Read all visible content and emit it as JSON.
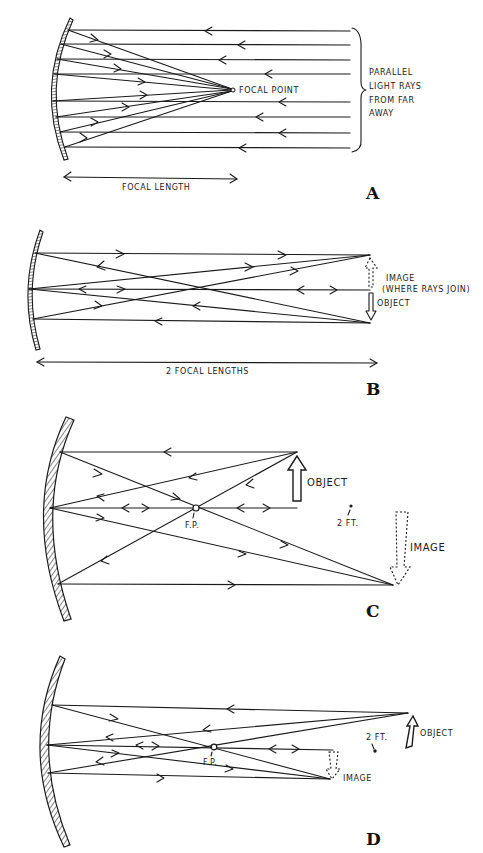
{
  "figure": {
    "ink_color": "#1a1a1a",
    "background": "#ffffff"
  },
  "panels": {
    "A": {
      "letter": "A",
      "labels": {
        "focal_point": "FOCAL POINT",
        "parallel_1": "PARALLEL",
        "parallel_2": "LIGHT RAYS",
        "parallel_3": "FROM FAR",
        "parallel_4": "AWAY",
        "focal_length": "FOCAL LENGTH"
      }
    },
    "B": {
      "letter": "B",
      "labels": {
        "image_1": "IMAGE",
        "image_2": "(WHERE RAYS JOIN)",
        "object": "OBJECT",
        "two_focal_lengths": "2 FOCAL LENGTHS"
      }
    },
    "C": {
      "letter": "C",
      "labels": {
        "object": "OBJECT",
        "fp": "F.P.",
        "two_ft": "2 FT.",
        "image": "IMAGE"
      }
    },
    "D": {
      "letter": "D",
      "labels": {
        "object": "OBJECT",
        "fp": "F.P.",
        "two_ft": "2 FT.",
        "image": "IMAGE"
      }
    }
  }
}
